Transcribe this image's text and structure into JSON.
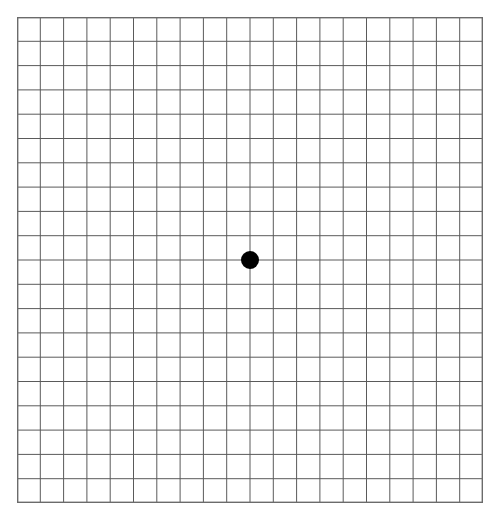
{
  "page": {
    "title": "Amsler Grid",
    "background_color": "#ffffff",
    "width": 499,
    "height": 519
  },
  "grid": {
    "name": "amsler-grid",
    "columns": 20,
    "rows": 20,
    "origin_x": 17,
    "origin_y": 17,
    "width": 466,
    "height": 486,
    "cell_width": 23.3,
    "cell_height": 24.3,
    "line_color": "#5a5a5a",
    "line_width": 1,
    "border_color": "#6b6b6b",
    "border_width": 1.4
  },
  "fixation_point": {
    "name": "center-fixation-dot",
    "center_x": 250,
    "center_y": 260,
    "diameter": 18,
    "color": "#000000",
    "grid_column": 10,
    "grid_row": 10
  },
  "labels": {
    "grid_description": "Amsler grid: 20 by 20 square chart with central fixation dot",
    "dot_description": "Central black fixation dot"
  },
  "chart_data": {
    "type": "table",
    "title": "Amsler Grid",
    "xlabel": "",
    "ylabel": "",
    "categories": [],
    "values": [],
    "grid": true,
    "legend": "none",
    "annotations": [
      {
        "label": "Central fixation dot",
        "x": 10,
        "y": 10
      }
    ],
    "xlim": [
      0,
      20
    ],
    "ylim": [
      0,
      20
    ]
  }
}
